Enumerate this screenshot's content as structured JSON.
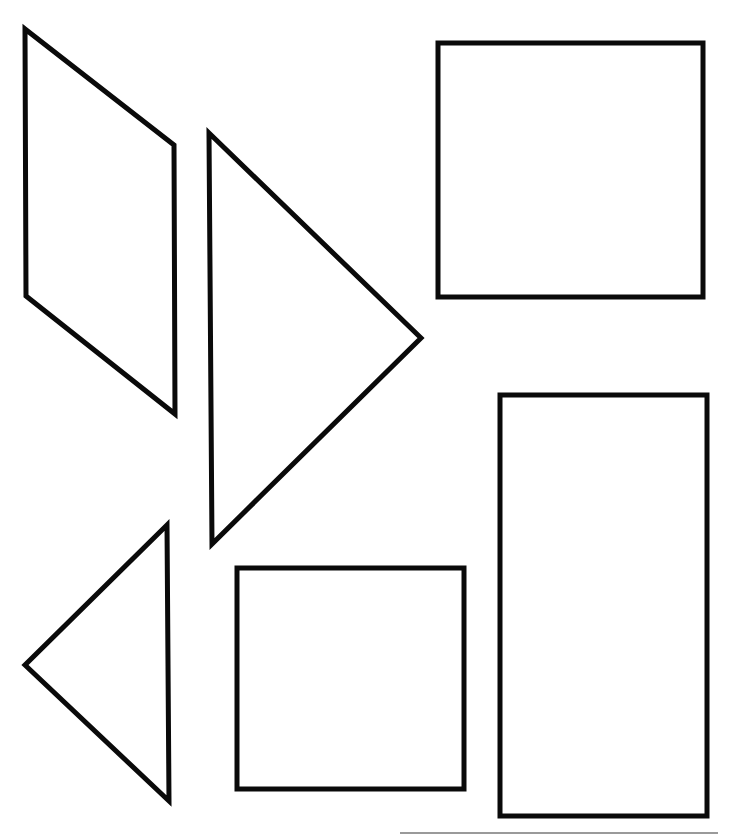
{
  "diagram": {
    "type": "tangram-pieces",
    "stroke_color": "#0a0a0a",
    "background": "#ffffff",
    "shapes": [
      {
        "id": "parallelogram",
        "kind": "parallelogram",
        "points": "25,29 174,145 175,414 26,296"
      },
      {
        "id": "large-triangle",
        "kind": "triangle",
        "points": "209,133 421,338 212,544"
      },
      {
        "id": "top-square",
        "kind": "square",
        "x": 438,
        "y": 43,
        "width": 265,
        "height": 254
      },
      {
        "id": "tall-rectangle",
        "kind": "rectangle",
        "x": 500,
        "y": 395,
        "width": 207,
        "height": 421
      },
      {
        "id": "bottom-square",
        "kind": "square",
        "x": 237,
        "y": 568,
        "width": 227,
        "height": 221
      },
      {
        "id": "small-triangle",
        "kind": "triangle",
        "points": "167,525 25,665 169,801"
      }
    ],
    "edge_line": {
      "x1": 400,
      "y1": 833,
      "x2": 718,
      "y2": 833
    }
  }
}
